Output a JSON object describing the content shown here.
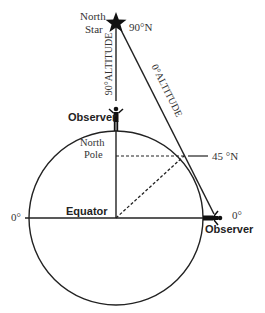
{
  "diagram": {
    "star_label_line1": "North",
    "star_label_line2": "Star",
    "star_latitude": "90°N",
    "vertical_altitude": "90°ALTITUDE",
    "slanted_altitude": "0°ALTITUDE",
    "top_observer": "Observer",
    "pole_line1": "North",
    "pole_line2": "Pole",
    "mid_latitude": "45 °N",
    "equator": "Equator",
    "left_degree": "0°",
    "right_degree": "0°",
    "side_observer": "Observer"
  }
}
